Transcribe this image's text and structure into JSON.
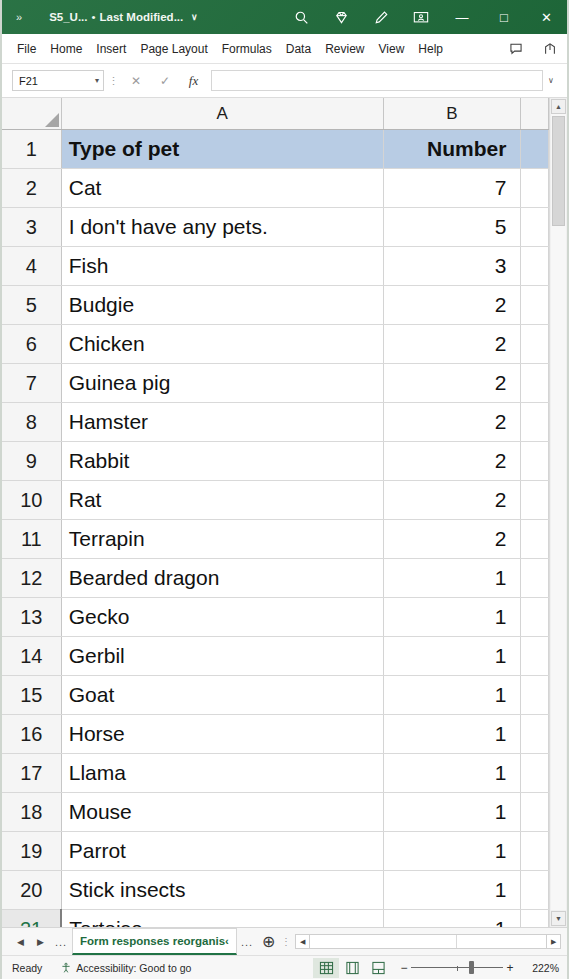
{
  "titlebar": {
    "overflow_chevrons": "»",
    "filename": "S5_U...",
    "separator": "•",
    "modified_label": "Last Modified...",
    "dropdown_caret": "∨",
    "icons": [
      "search-icon",
      "diamond-icon",
      "pen-icon",
      "presence-icon"
    ],
    "window_buttons": {
      "minimize": "—",
      "maximize": "□",
      "close": "✕"
    }
  },
  "ribbon": {
    "tabs": [
      {
        "label": "File"
      },
      {
        "label": "Home"
      },
      {
        "label": "Insert"
      },
      {
        "label": "Page Layout"
      },
      {
        "label": "Formulas"
      },
      {
        "label": "Data"
      },
      {
        "label": "Review"
      },
      {
        "label": "View"
      },
      {
        "label": "Help"
      }
    ],
    "right_icons": [
      "comments-icon",
      "share-icon"
    ]
  },
  "formula_bar": {
    "name_box_value": "F21",
    "name_box_caret": "▾",
    "cancel_label": "✕",
    "enter_label": "✓",
    "function_label": "fx",
    "formula_value": "",
    "expand_caret": "∨"
  },
  "grid": {
    "column_headers": [
      "A",
      "B"
    ],
    "columns": [
      {
        "id": "A",
        "label": "A"
      },
      {
        "id": "B",
        "label": "B"
      }
    ],
    "selected_cell": "F21",
    "active_row": 21,
    "header_row_index": 1,
    "scrollbar": {
      "up": "▲",
      "down": "▼"
    },
    "rows": [
      {
        "n": "1",
        "a": "Type of pet",
        "b": "Number"
      },
      {
        "n": "2",
        "a": "Cat",
        "b": "7"
      },
      {
        "n": "3",
        "a": "I don't have any pets.",
        "b": "5"
      },
      {
        "n": "4",
        "a": "Fish",
        "b": "3"
      },
      {
        "n": "5",
        "a": "Budgie",
        "b": "2"
      },
      {
        "n": "6",
        "a": "Chicken",
        "b": "2"
      },
      {
        "n": "7",
        "a": "Guinea pig",
        "b": "2"
      },
      {
        "n": "8",
        "a": "Hamster",
        "b": "2"
      },
      {
        "n": "9",
        "a": "Rabbit",
        "b": "2"
      },
      {
        "n": "10",
        "a": "Rat",
        "b": "2"
      },
      {
        "n": "11",
        "a": "Terrapin",
        "b": "2"
      },
      {
        "n": "12",
        "a": "Bearded dragon",
        "b": "1"
      },
      {
        "n": "13",
        "a": "Gecko",
        "b": "1"
      },
      {
        "n": "14",
        "a": "Gerbil",
        "b": "1"
      },
      {
        "n": "15",
        "a": "Goat",
        "b": "1"
      },
      {
        "n": "16",
        "a": "Horse",
        "b": "1"
      },
      {
        "n": "17",
        "a": "Llama",
        "b": "1"
      },
      {
        "n": "18",
        "a": "Mouse",
        "b": "1"
      },
      {
        "n": "19",
        "a": "Parrot",
        "b": "1"
      },
      {
        "n": "20",
        "a": "Stick insects",
        "b": "1"
      },
      {
        "n": "21",
        "a": "Tortoise",
        "b": "1"
      }
    ]
  },
  "sheet_tabs": {
    "first_arrow": "◀",
    "last_arrow": "▶",
    "left_ellipsis": "...",
    "active_tab": "Form responses reorganis‹",
    "right_ellipsis": "...",
    "add_sheet": "⊕",
    "hscroll_left": "◀",
    "hscroll_right": "▶"
  },
  "status_bar": {
    "mode": "Ready",
    "accessibility": "Accessibility: Good to go",
    "views": [
      "normal-view-icon",
      "page-layout-icon",
      "page-break-icon"
    ],
    "active_view": "normal-view-icon",
    "zoom_out": "−",
    "zoom_in": "+",
    "zoom_level": "222%"
  },
  "colors": {
    "title_bar_green": "#1f6b3b",
    "header_fill": "#b8cce4",
    "excel_accent": "#217346"
  }
}
